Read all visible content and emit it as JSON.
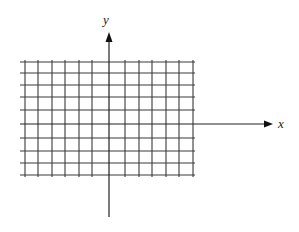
{
  "diagram": {
    "type": "coordinate-grid",
    "axes": {
      "x_label": "x",
      "y_label": "y"
    },
    "grid": {
      "left": 20,
      "right": 195,
      "vertical_lines_x": [
        25,
        38,
        52,
        65,
        79,
        92,
        125,
        139,
        152,
        166,
        179,
        193
      ],
      "horizontal_lines_y": [
        62,
        73,
        85,
        97,
        110,
        138,
        151,
        163,
        175
      ],
      "top": 62,
      "bottom": 175
    },
    "x_axis": {
      "y": 124,
      "x_start": 20,
      "x_end": 273
    },
    "y_axis": {
      "x": 109,
      "y_start": 217,
      "y_end": 32
    },
    "colors": {
      "grid": "#3a3a3a",
      "axis": "#222222",
      "background": "#ffffff"
    }
  }
}
